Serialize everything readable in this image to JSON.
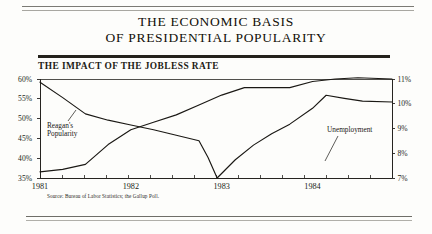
{
  "document": {
    "title_line_1": "THE ECONOMIC BASIS",
    "title_line_2": "OF PRESIDENTIAL POPULARITY",
    "subtitle": "THE IMPACT OF THE JOBLESS RATE",
    "source": "Source: Bureau of Labor Statistics; the Gallup Poll."
  },
  "chart_data": {
    "type": "line",
    "title": "THE IMPACT OF THE JOBLESS RATE",
    "xlabel": "",
    "ylabel": "",
    "grid": false,
    "legend": "inline-annotations",
    "x_tick_labels": [
      "1981",
      "1982",
      "1983",
      "1984"
    ],
    "x_tick_positions": [
      0,
      4,
      8,
      12
    ],
    "x_minor_ticks": 16,
    "xlim": [
      0,
      15.5
    ],
    "left_axis": {
      "name": "Reagan's Popularity",
      "unit": "%",
      "ylim": [
        35,
        60
      ],
      "ticks": [
        35,
        40,
        45,
        50,
        55,
        60
      ],
      "tick_labels": [
        "35%",
        "40%",
        "45%",
        "50%",
        "55%",
        "60%"
      ]
    },
    "right_axis": {
      "name": "Unemployment",
      "unit": "%",
      "ylim": [
        7,
        11
      ],
      "ticks": [
        7,
        8,
        9,
        10,
        11
      ],
      "tick_labels": [
        "7%",
        "8%",
        "9%",
        "10%",
        "11%"
      ]
    },
    "series": [
      {
        "name": "Reagan's Popularity",
        "axis": "left",
        "label": "Reagan's",
        "label_2": "Popularity",
        "x": [
          0,
          1,
          2,
          3,
          4,
          5,
          6,
          7,
          7.4,
          7.8,
          8.6,
          9.4,
          10.2,
          11,
          12,
          12.6,
          13.4,
          14.2,
          15.5
        ],
        "values": [
          59.2,
          55.3,
          51.2,
          49.6,
          48.4,
          47.2,
          45.8,
          44.4,
          40.2,
          35.0,
          39.6,
          43.3,
          46.2,
          48.6,
          52.6,
          55.9,
          55.1,
          54.4,
          54.2
        ]
      },
      {
        "name": "Unemployment",
        "axis": "right",
        "label": "Unemployment",
        "x": [
          0,
          1,
          2,
          3,
          4,
          5,
          6,
          7,
          8,
          9,
          10,
          11,
          12,
          13,
          14,
          15.5
        ],
        "values": [
          7.25,
          7.35,
          7.55,
          8.35,
          8.95,
          9.25,
          9.55,
          9.95,
          10.35,
          10.65,
          10.65,
          10.65,
          10.9,
          11.0,
          11.05,
          11.0
        ]
      }
    ]
  }
}
